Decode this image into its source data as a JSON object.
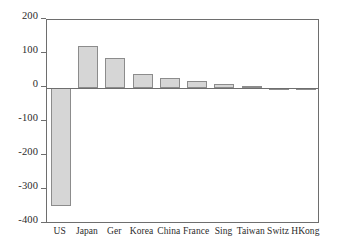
{
  "chart_data": {
    "type": "bar",
    "title": "",
    "xlabel": "",
    "ylabel": "",
    "categories": [
      "US",
      "Japan",
      "Ger",
      "Korea",
      "China",
      "France",
      "Sing",
      "Taiwan",
      "Switz",
      "HKong"
    ],
    "values": [
      -347,
      125,
      88,
      41,
      30,
      20,
      12,
      5,
      1,
      -4
    ],
    "ylim": [
      -400,
      200
    ],
    "yticks": [
      200,
      100,
      0,
      -100,
      -200,
      -300,
      -400
    ],
    "ytick_labels": [
      "200",
      "100",
      "0",
      "-100",
      "-200",
      "-300",
      "-400"
    ],
    "grid": false,
    "legend": null,
    "bar_fill_color": "#d6d6d6",
    "bar_edge_color": "#8c8c8c",
    "axis_color": "#6e6e6e",
    "background_color": "#ffffff"
  }
}
